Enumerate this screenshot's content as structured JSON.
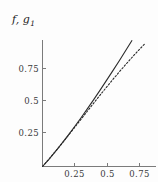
{
  "figure": {
    "axis_label": "f, g",
    "axis_label_subscript": "1",
    "background_color": "#fdfdfd",
    "axis_color": "#7b7b7b",
    "curve_color": "#2b2b2b"
  },
  "chart_data": {
    "type": "line",
    "title": "",
    "subtitle": "",
    "xlabel": "",
    "ylabel": "f, g1",
    "xlim": [
      0,
      0.8
    ],
    "ylim": [
      0,
      0.88
    ],
    "grid": false,
    "legend_position": "none",
    "xticks": [
      0.25,
      0.5,
      0.75
    ],
    "xtick_labels": [
      "0.25",
      "0.5",
      "0.75"
    ],
    "yticks": [
      0.25,
      0.5,
      0.75
    ],
    "ytick_labels": [
      "0.25",
      "0.5",
      "0.75"
    ],
    "series": [
      {
        "name": "f",
        "style": "solid",
        "color": "#2b2b2b",
        "x": [
          0,
          0.05,
          0.1,
          0.15,
          0.2,
          0.25,
          0.3,
          0.35,
          0.4,
          0.45,
          0.5,
          0.55,
          0.6,
          0.65,
          0.7,
          0.75,
          0.8
        ],
        "y": [
          0,
          0.053,
          0.109,
          0.168,
          0.229,
          0.292,
          0.357,
          0.424,
          0.492,
          0.562,
          0.633,
          0.705,
          0.778,
          0.853,
          0.928,
          1.004,
          1.08
        ]
      },
      {
        "name": "g1",
        "style": "dashed",
        "color": "#2b2b2b",
        "x": [
          0,
          0.05,
          0.1,
          0.15,
          0.2,
          0.25,
          0.3,
          0.35,
          0.4,
          0.45,
          0.5,
          0.55,
          0.6,
          0.65,
          0.7,
          0.75,
          0.8
        ],
        "y": [
          0,
          0.054,
          0.11,
          0.167,
          0.226,
          0.286,
          0.346,
          0.406,
          0.466,
          0.525,
          0.583,
          0.64,
          0.696,
          0.75,
          0.803,
          0.854,
          0.903
        ]
      }
    ],
    "annotations": [
      {
        "text": "curves are tangent near x = 0.3; solid curve rises above dashed curve for larger x"
      }
    ]
  }
}
